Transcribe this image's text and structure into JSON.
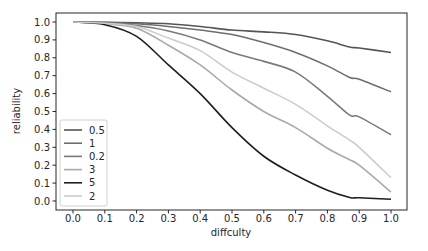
{
  "chart_data": {
    "type": "line",
    "title": "",
    "xlabel": "diffculty",
    "ylabel": "reliability",
    "xlim": [
      -0.05,
      1.05
    ],
    "ylim": [
      -0.05,
      1.05
    ],
    "xticks": [
      "0.0",
      "0.1",
      "0.2",
      "0.3",
      "0.4",
      "0.5",
      "0.6",
      "0.7",
      "0.8",
      "0.9",
      "1.0"
    ],
    "yticks": [
      "0.0",
      "0.1",
      "0.2",
      "0.3",
      "0.4",
      "0.5",
      "0.6",
      "0.7",
      "0.8",
      "0.9",
      "1.0"
    ],
    "grid": false,
    "legend_position": "lower left",
    "x": [
      0.0,
      0.1,
      0.2,
      0.3,
      0.4,
      0.5,
      0.6,
      0.7,
      0.8,
      0.87,
      0.9,
      1.0
    ],
    "series": [
      {
        "name": "0.5",
        "color": "#555555",
        "values": [
          1.0,
          0.998,
          0.995,
          0.99,
          0.975,
          0.955,
          0.945,
          0.93,
          0.895,
          0.86,
          0.855,
          0.83
        ]
      },
      {
        "name": "1",
        "color": "#6e6e6e",
        "values": [
          1.0,
          0.997,
          0.99,
          0.975,
          0.955,
          0.93,
          0.885,
          0.83,
          0.755,
          0.69,
          0.68,
          0.61
        ]
      },
      {
        "name": "0.2",
        "color": "#7a7a7a",
        "values": [
          1.0,
          0.995,
          0.98,
          0.95,
          0.9,
          0.83,
          0.78,
          0.72,
          0.585,
          0.48,
          0.47,
          0.37
        ]
      },
      {
        "name": "3",
        "color": "#a9a9a9",
        "values": [
          1.0,
          0.99,
          0.965,
          0.87,
          0.76,
          0.62,
          0.5,
          0.41,
          0.295,
          0.23,
          0.2,
          0.05
        ]
      },
      {
        "name": "5",
        "color": "#1e1e1e",
        "values": [
          1.0,
          0.985,
          0.92,
          0.76,
          0.6,
          0.41,
          0.25,
          0.145,
          0.06,
          0.02,
          0.018,
          0.01
        ]
      },
      {
        "name": "2",
        "color": "#cccccc",
        "values": [
          1.0,
          0.993,
          0.975,
          0.91,
          0.84,
          0.72,
          0.63,
          0.54,
          0.42,
          0.34,
          0.3,
          0.13
        ]
      }
    ]
  }
}
